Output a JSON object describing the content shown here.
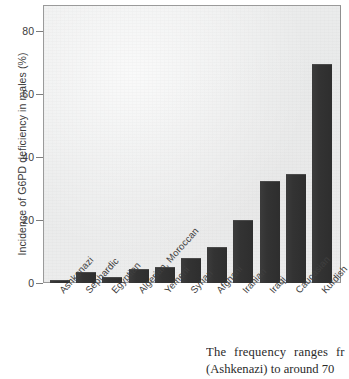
{
  "chart_data": {
    "type": "bar",
    "title": "",
    "xlabel": "",
    "ylabel": "Incidence of G6PD deficiency in males (%)",
    "ylim": [
      0,
      88
    ],
    "yticks": [
      0,
      20,
      40,
      60,
      80
    ],
    "ytick_labels": [
      "0",
      "20",
      "40",
      "60",
      "80"
    ],
    "grid": false,
    "legend": null,
    "bar_color": "#333333",
    "plot_background": "#ececec",
    "categories": [
      "Ashkenazi",
      "Sephardic",
      "Egyptian",
      "Algerian, Moroccan",
      "Yemeni",
      "Syrian",
      "Afghani",
      "Iranian",
      "Iraqi",
      "Caucasian",
      "Kurdish"
    ],
    "values": [
      1,
      3.5,
      2,
      4.5,
      5,
      8,
      11.5,
      20,
      32.5,
      34.5,
      69.5
    ]
  },
  "caption": {
    "line1": "The frequency ranges fr",
    "line2": "(Ashkenazi) to around 70"
  }
}
